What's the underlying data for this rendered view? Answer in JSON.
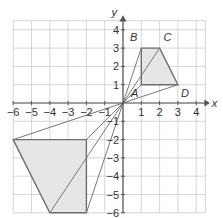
{
  "diagram": {
    "type": "coordinate-plane-enlargement",
    "axes": {
      "x_label": "x",
      "y_label": "y",
      "x_ticks": [
        "-6",
        "-5",
        "-4",
        "-3",
        "-2",
        "-1",
        "1",
        "2",
        "3",
        "4"
      ],
      "y_ticks": [
        "4",
        "3",
        "2",
        "1",
        "-1",
        "-2",
        "-3",
        "-4",
        "-5",
        "-6"
      ],
      "x_range": [
        -6,
        4.5
      ],
      "y_range": [
        -6,
        4.5
      ]
    },
    "shape_small": {
      "name": "ABCD",
      "vertices": [
        {
          "label": "A",
          "x": 1,
          "y": 1
        },
        {
          "label": "B",
          "x": 1,
          "y": 3
        },
        {
          "label": "C",
          "x": 2,
          "y": 3
        },
        {
          "label": "D",
          "x": 3,
          "y": 1
        }
      ],
      "fill": "#e6e6e6",
      "stroke": "#666666"
    },
    "shape_large": {
      "vertices": [
        {
          "x": -2,
          "y": -2
        },
        {
          "x": -2,
          "y": -6
        },
        {
          "x": -4,
          "y": -6
        },
        {
          "x": -6,
          "y": -2
        }
      ],
      "fill": "#e6e6e6",
      "stroke": "#666666"
    },
    "centre_of_enlargement": {
      "x": 0,
      "y": 0
    },
    "rays": [
      {
        "from": [
          1,
          3
        ],
        "to": [
          -2,
          -6
        ]
      },
      {
        "from": [
          2,
          3
        ],
        "to": [
          -4,
          -6
        ]
      },
      {
        "from": [
          3,
          1
        ],
        "to": [
          -6,
          -2
        ]
      },
      {
        "from": [
          1,
          1
        ],
        "to": [
          -2,
          -2
        ]
      }
    ],
    "colors": {
      "grid": "#cccccc",
      "axis": "#555555",
      "shape_fill": "#e6e6e6",
      "shape_stroke": "#6e6e6e",
      "ray": "#7a7a7a"
    }
  }
}
